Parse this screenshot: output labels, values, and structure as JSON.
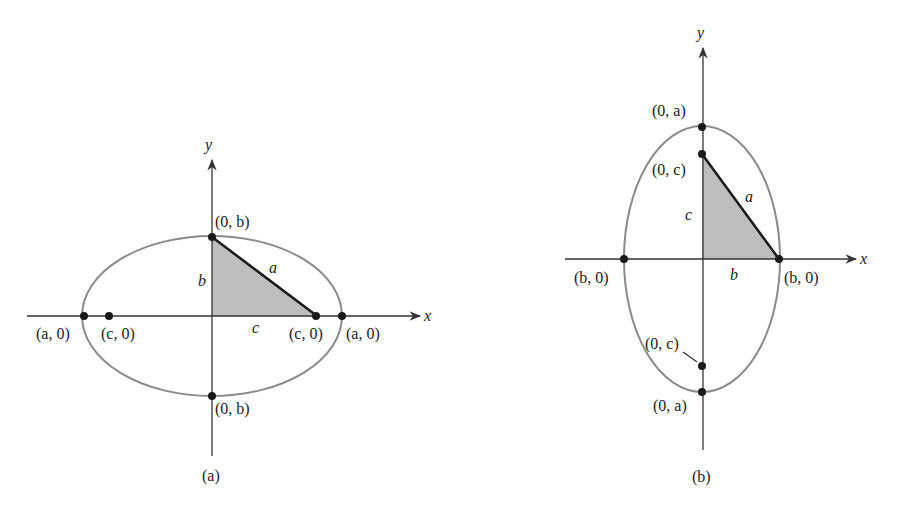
{
  "figure_a": {
    "caption": "(a)",
    "axis_x_label": "x",
    "axis_y_label": "y",
    "points": {
      "top_vertex": "(0, b)",
      "bottom_vertex": "(0, b)",
      "left_vertex": "(a, 0)",
      "right_vertex": "(a, 0)",
      "left_focus": "(c, 0)",
      "right_focus": "(c, 0)"
    },
    "triangle_sides": {
      "vertical": "b",
      "hypotenuse": "a",
      "horizontal": "c"
    }
  },
  "figure_b": {
    "caption": "(b)",
    "axis_x_label": "x",
    "axis_y_label": "y",
    "points": {
      "top_vertex": "(0, a)",
      "bottom_vertex": "(0, a)",
      "top_focus": "(0, c)",
      "bottom_focus": "(0, c)",
      "left_vertex": "(b, 0)",
      "right_vertex": "(b, 0)"
    },
    "triangle_sides": {
      "vertical": "c",
      "hypotenuse": "a",
      "horizontal": "b"
    }
  },
  "colors": {
    "ellipse": "#8a8a8a",
    "axis": "#333333",
    "triangle_fill": "#bdbdbd",
    "hypotenuse": "#1a1a1a",
    "point": "#1a1a1a"
  }
}
